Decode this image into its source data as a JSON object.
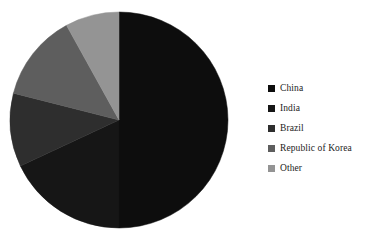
{
  "chart_data": {
    "type": "pie",
    "title": "",
    "subtitle": "",
    "xlabel": "",
    "ylabel": "",
    "grid": false,
    "legend_position": "right",
    "start_angle_deg": 0,
    "direction": "clockwise",
    "center": {
      "x": 119,
      "y": 120
    },
    "radius": {
      "x": 109,
      "y": 108
    },
    "categories": [
      "China",
      "India",
      "Brazil",
      "Republic of Korea",
      "Other"
    ],
    "values": [
      50,
      18,
      11,
      13,
      8
    ],
    "unit": "%",
    "slices": [
      {
        "label": "China",
        "value": 50,
        "color": "#0d0d0d",
        "start_angle_deg": 0,
        "end_angle_deg": 180
      },
      {
        "label": "India",
        "value": 18,
        "color": "#161616",
        "start_angle_deg": 180,
        "end_angle_deg": 244.8
      },
      {
        "label": "Brazil",
        "value": 11,
        "color": "#2e2e2e",
        "start_angle_deg": 244.8,
        "end_angle_deg": 284.4
      },
      {
        "label": "Republic of Korea",
        "value": 13,
        "color": "#5e5e5e",
        "start_angle_deg": 284.4,
        "end_angle_deg": 331.2
      },
      {
        "label": "Other",
        "value": 8,
        "color": "#949494",
        "start_angle_deg": 331.2,
        "end_angle_deg": 360
      }
    ]
  },
  "legend": {
    "items": [
      {
        "label": "China",
        "color": "#0d0d0d"
      },
      {
        "label": "India",
        "color": "#161616"
      },
      {
        "label": "Brazil",
        "color": "#2e2e2e"
      },
      {
        "label": "Republic of Korea",
        "color": "#5e5e5e"
      },
      {
        "label": "Other",
        "color": "#949494"
      }
    ]
  },
  "canvas": {
    "background": "#ffffff",
    "width": 376,
    "height": 248
  }
}
